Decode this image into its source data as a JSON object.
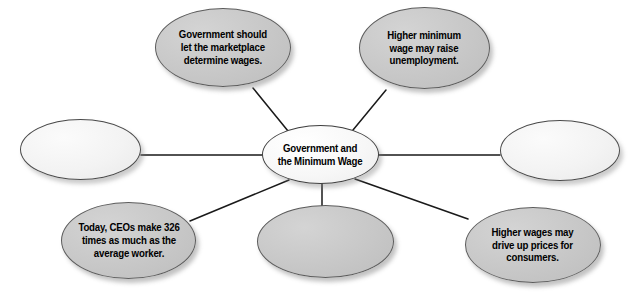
{
  "diagram": {
    "type": "concept-map",
    "title_node": "Government and the Minimum Wage",
    "background_color": "#ffffff",
    "line_color": "#1a1a1a",
    "gray_fill": "#c9c9c9",
    "light_fill": "#f3f3f3",
    "text_color": "#000000",
    "center": {
      "label": "Government and\nthe Minimum Wage",
      "fill": "light"
    },
    "satellites": [
      {
        "id": "top-left",
        "label": "Government should\nlet the marketplace\ndetermine wages.",
        "fill": "gray",
        "empty": false
      },
      {
        "id": "top-right",
        "label": "Higher minimum\nwage may raise\nunemployment.",
        "fill": "gray",
        "empty": false
      },
      {
        "id": "left",
        "label": "",
        "fill": "light",
        "empty": true
      },
      {
        "id": "right",
        "label": "",
        "fill": "light",
        "empty": true
      },
      {
        "id": "bottom-left",
        "label": "Today, CEOs make 326\ntimes as much as the\naverage worker.",
        "fill": "gray",
        "empty": false
      },
      {
        "id": "bottom-center",
        "label": "",
        "fill": "gray",
        "empty": true
      },
      {
        "id": "bottom-right",
        "label": "Higher wages may\ndrive up prices for\nconsumers.",
        "fill": "gray",
        "empty": false
      }
    ]
  }
}
